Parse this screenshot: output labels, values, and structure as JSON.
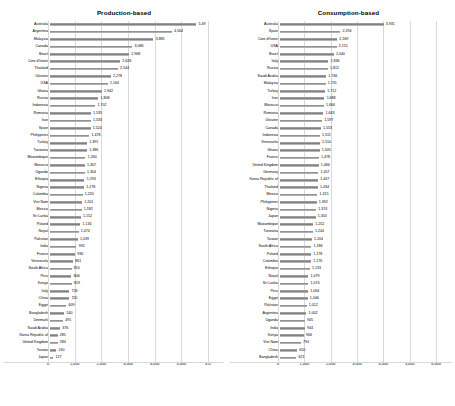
{
  "chart_data": [
    {
      "type": "bar",
      "orientation": "horizontal",
      "title": "Production-based",
      "xlabel": "",
      "ylabel": "",
      "xlim": [
        0,
        6000
      ],
      "xticks": [
        "0",
        "1,000",
        "2,000",
        "3,000",
        "4,000",
        "5,000",
        "6,0"
      ],
      "grid": true,
      "legend": "none",
      "categories": [
        "Australia",
        "Argentina",
        "Malaysia",
        "Canada",
        "Brazil",
        "Cote d'Ivoire",
        "Thailand",
        "Ukraine",
        "USA",
        "Ghana",
        "Russia",
        "Indonesia",
        "Romania",
        "Iran",
        "Spain",
        "Philippines",
        "Turkey",
        "Tanzania",
        "Mozambique",
        "Morocco",
        "Uganda",
        "Ethiopia",
        "Nigeria",
        "Colombia",
        "Viet Nam",
        "Mexico",
        "Sri Lanka",
        "Poland",
        "Nepal",
        "Pakistan",
        "India",
        "France",
        "Venezuela",
        "South Africa",
        "Peru",
        "Kenya",
        "Italy",
        "China",
        "Egypt",
        "Bangladesh",
        "Denmark",
        "Saudi Arabia",
        "Korea Republic of",
        "United Kingdom",
        "Taiwan",
        "Japan"
      ],
      "values": [
        5491,
        4564,
        3881,
        3086,
        2968,
        2626,
        2544,
        2278,
        2164,
        1942,
        1808,
        1702,
        1535,
        1533,
        1524,
        1478,
        1391,
        1386,
        1330,
        1307,
        1304,
        1293,
        1278,
        1220,
        1201,
        1182,
        1152,
        1134,
        1074,
        1039,
        992,
        936,
        861,
        810,
        806,
        819,
        726,
        720,
        609,
        540,
        491,
        376,
        285,
        284,
        240,
        127
      ],
      "value_labels": [
        "5,49",
        "4,564",
        "3,881",
        "3,086",
        "2,968",
        "2,626",
        "2,544",
        "2,278",
        "2,164",
        "1,942",
        "1,808",
        "1,702",
        "1,535",
        "1,533",
        "1,524",
        "1,478",
        "1,391",
        "1,386",
        "1,330",
        "1,307",
        "1,304",
        "1,293",
        "1,278",
        "1,220",
        "1,201",
        "1,182",
        "1,152",
        "1,134",
        "1,074",
        "1,039",
        "992",
        "936",
        "861",
        "810",
        "806",
        "819",
        "726",
        "720",
        "609",
        "540",
        "491",
        "376",
        "285",
        "284",
        "240",
        "127"
      ]
    },
    {
      "type": "bar",
      "orientation": "horizontal",
      "title": "Consumption-based",
      "xlabel": "",
      "ylabel": "",
      "xlim": [
        0,
        6000
      ],
      "xticks": [
        "0",
        "1,000",
        "2,000",
        "3,000",
        "4,000",
        "5,000",
        "6,000"
      ],
      "grid": true,
      "legend": "none",
      "categories": [
        "Australia",
        "Spain",
        "Cote d'Ivoire",
        "USA",
        "Brazil",
        "Italy",
        "Russia",
        "Saudi Arabia",
        "Malaysia",
        "Turkey",
        "Iran",
        "Morocco",
        "Romania",
        "Ukraine",
        "Canada",
        "Indonesia",
        "Venezuela",
        "Ghana",
        "France",
        "United Kingdom",
        "Germany",
        "Korea Republic of",
        "Thailand",
        "Mexico",
        "Philippines",
        "Nigeria",
        "Japan",
        "Mozambique",
        "Tanzania",
        "Taiwan",
        "South Africa",
        "Poland",
        "Colombia",
        "Ethiopia",
        "Nepal",
        "Sri Lanka",
        "Peru",
        "Egypt",
        "Pakistan",
        "Argentina",
        "Uganda",
        "India",
        "Kenya",
        "Viet Nam",
        "China",
        "Bangladesh"
      ],
      "values": [
        3931,
        2294,
        2169,
        2151,
        2040,
        1836,
        1812,
        1746,
        1731,
        1712,
        1688,
        1666,
        1643,
        1597,
        1553,
        1511,
        1510,
        1505,
        1478,
        1466,
        1457,
        1447,
        1434,
        1415,
        1392,
        1374,
        1350,
        1252,
        1244,
        1204,
        1186,
        1178,
        1176,
        1133,
        1079,
        1074,
        1064,
        1046,
        1012,
        1002,
        945,
        944,
        906,
        794,
        650,
        621
      ],
      "value_labels": [
        "3,931",
        "2,294",
        "2,169",
        "2,151",
        "2,040",
        "1,836",
        "1,812",
        "1,746",
        "1,731",
        "1,712",
        "1,688",
        "1,666",
        "1,643",
        "1,597",
        "1,553",
        "1,511",
        "1,510",
        "1,505",
        "1,478",
        "1,466",
        "1,457",
        "1,447",
        "1,434",
        "1,415",
        "1,392",
        "1,374",
        "1,350",
        "1,252",
        "1,244",
        "1,204",
        "1,186",
        "1,178",
        "1,176",
        "1,133",
        "1,079",
        "1,074",
        "1,064",
        "1,046",
        "1,012",
        "1,002",
        "945",
        "944",
        "906",
        "794",
        "650",
        "621"
      ]
    }
  ],
  "colors": {
    "bar": "#808080",
    "grid": "#d9d9d9",
    "text": "#000000",
    "background": "#ffffff"
  }
}
